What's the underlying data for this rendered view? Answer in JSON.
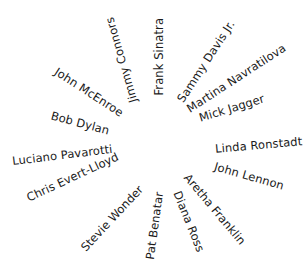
{
  "diagram": {
    "type": "radial-word-wheel",
    "names": [
      {
        "label": "Jimmy Connors",
        "cx": 122,
        "cy": 60,
        "rotate": -106
      },
      {
        "label": "Frank Sinatra",
        "cx": 160,
        "cy": 57,
        "rotate": -90
      },
      {
        "label": "Sammy Davis Jr.",
        "cx": 206,
        "cy": 62,
        "rotate": -57
      },
      {
        "label": "Martina Navratilova",
        "cx": 236,
        "cy": 79,
        "rotate": -33
      },
      {
        "label": "Mick Jagger",
        "cx": 232,
        "cy": 109,
        "rotate": -17
      },
      {
        "label": "Linda Ronstadt",
        "cx": 258,
        "cy": 146,
        "rotate": -5
      },
      {
        "label": "John Lennon",
        "cx": 249,
        "cy": 177,
        "rotate": 16
      },
      {
        "label": "Aretha Franklin",
        "cx": 214,
        "cy": 210,
        "rotate": 50
      },
      {
        "label": "Diana Ross",
        "cx": 188,
        "cy": 222,
        "rotate": 68
      },
      {
        "label": "Pat Benatar",
        "cx": 155,
        "cy": 226,
        "rotate": -82
      },
      {
        "label": "Stevie Wonder",
        "cx": 112,
        "cy": 219,
        "rotate": -47
      },
      {
        "label": "Chris Evert-Lloyd",
        "cx": 73,
        "cy": 178,
        "rotate": -25
      },
      {
        "label": "Luciano Pavarotti",
        "cx": 62,
        "cy": 156,
        "rotate": -7
      },
      {
        "label": "Bob Dylan",
        "cx": 80,
        "cy": 124,
        "rotate": 15
      },
      {
        "label": "John McEnroe",
        "cx": 88,
        "cy": 93,
        "rotate": 33
      }
    ]
  }
}
